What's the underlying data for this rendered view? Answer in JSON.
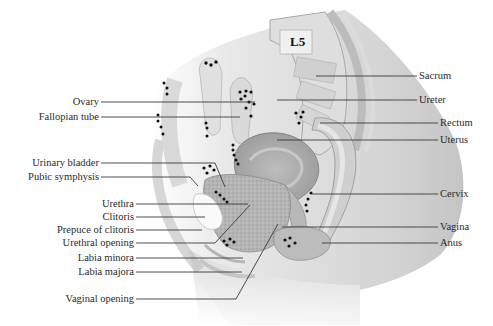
{
  "figure": {
    "vertebra_label": "L5",
    "left_labels": [
      {
        "id": "ovary",
        "text": "Ovary",
        "x_end": 101,
        "y": 102,
        "tx": 255,
        "ty": 102
      },
      {
        "id": "fallopian-tube",
        "text": "Fallopian tube",
        "x_end": 101,
        "y": 117,
        "tx": 240,
        "ty": 117
      },
      {
        "id": "urinary-bladder",
        "text": "Urinary bladder",
        "x_end": 101,
        "y": 163,
        "tx": 215,
        "ty": 163,
        "bend": [
          225,
          187
        ]
      },
      {
        "id": "pubic-symphysis",
        "text": "Pubic symphysis",
        "x_end": 101,
        "y": 177,
        "tx": 190,
        "ty": 177,
        "bend": [
          198,
          186
        ]
      },
      {
        "id": "urethra",
        "text": "Urethra",
        "x_end": 136,
        "y": 204,
        "tx": 248,
        "ty": 204
      },
      {
        "id": "clitoris",
        "text": "Clitoris",
        "x_end": 136,
        "y": 217,
        "tx": 205,
        "ty": 217
      },
      {
        "id": "prepuce-of-clitoris",
        "text": "Prepuce of clitoris",
        "x_end": 136,
        "y": 230,
        "tx": 202,
        "ty": 230
      },
      {
        "id": "urethral-opening",
        "text": "Urethral opening",
        "x_end": 136,
        "y": 243,
        "tx": 215,
        "ty": 243,
        "bend": [
          250,
          205
        ]
      },
      {
        "id": "labia-minora",
        "text": "Labia minora",
        "x_end": 136,
        "y": 258,
        "tx": 243,
        "ty": 258
      },
      {
        "id": "labia-majora",
        "text": "Labia majora",
        "x_end": 136,
        "y": 272,
        "tx": 242,
        "ty": 272
      },
      {
        "id": "vaginal-opening",
        "text": "Vaginal opening",
        "x_end": 136,
        "y": 299,
        "tx": 236,
        "ty": 299,
        "bend": [
          278,
          224
        ]
      }
    ],
    "right_labels": [
      {
        "id": "sacrum",
        "text": "Sacrum",
        "x_start": 417,
        "y": 76,
        "tx": 316,
        "ty": 76
      },
      {
        "id": "ureter",
        "text": "Ureter",
        "x_start": 417,
        "y": 100,
        "tx": 277,
        "ty": 100
      },
      {
        "id": "rectum",
        "text": "Rectum",
        "x_start": 438,
        "y": 123,
        "tx": 320,
        "ty": 123
      },
      {
        "id": "uterus",
        "text": "Uterus",
        "x_start": 438,
        "y": 140,
        "tx": 277,
        "ty": 140
      },
      {
        "id": "cervix",
        "text": "Cervix",
        "x_start": 438,
        "y": 194,
        "tx": 312,
        "ty": 194
      },
      {
        "id": "vagina",
        "text": "Vagina",
        "x_start": 438,
        "y": 227,
        "tx": 282,
        "ty": 227
      },
      {
        "id": "anus",
        "text": "Anus",
        "x_start": 438,
        "y": 243,
        "tx": 322,
        "ty": 243
      }
    ],
    "colors": {
      "leader_line": "#3a3a3a",
      "label_text": "#2a2a2a",
      "tissue_light": "#e6e6e6",
      "tissue_mid": "#c9c9c9",
      "tissue_dark": "#9e9e9e",
      "dots": "#111111"
    }
  }
}
